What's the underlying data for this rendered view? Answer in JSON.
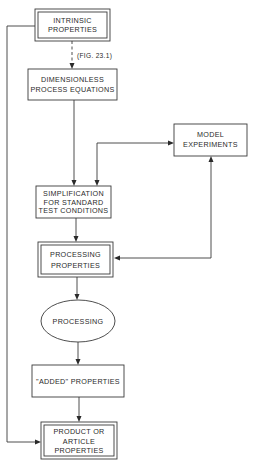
{
  "diagram": {
    "type": "flowchart",
    "nodes": {
      "intrinsic": {
        "lines": [
          "INTRINSIC",
          "PROPERTIES"
        ],
        "shape": "double-box"
      },
      "dimensionless": {
        "lines": [
          "DIMENSIONLESS",
          "PROCESS EQUATIONS"
        ],
        "shape": "box"
      },
      "model": {
        "lines": [
          "MODEL",
          "EXPERIMENTS"
        ],
        "shape": "box"
      },
      "simplification": {
        "lines": [
          "SIMPLIFICATION",
          "FOR STANDARD",
          "TEST CONDITIONS"
        ],
        "shape": "box"
      },
      "processing_properties": {
        "lines": [
          "PROCESSING",
          "PROPERTIES"
        ],
        "shape": "double-box"
      },
      "processing": {
        "lines": [
          "PROCESSING"
        ],
        "shape": "ellipse"
      },
      "added": {
        "lines": [
          "\"ADDED\" PROPERTIES"
        ],
        "shape": "box"
      },
      "product": {
        "lines": [
          "PRODUCT OR",
          "ARTICLE",
          "PROPERTIES"
        ],
        "shape": "double-box"
      }
    },
    "edges": [
      {
        "from": "intrinsic",
        "to": "dimensionless",
        "style": "dashed",
        "label": "(FIG. 23.1)"
      },
      {
        "from": "dimensionless",
        "to": "simplification",
        "style": "solid"
      },
      {
        "from": "model",
        "to": "simplification",
        "style": "solid",
        "bidirectional": true
      },
      {
        "from": "processing_properties",
        "to": "model",
        "style": "solid",
        "bidirectional": true
      },
      {
        "from": "simplification",
        "to": "processing_properties",
        "style": "solid"
      },
      {
        "from": "processing_properties",
        "to": "processing",
        "style": "solid"
      },
      {
        "from": "processing",
        "to": "added",
        "style": "solid"
      },
      {
        "from": "added",
        "to": "product",
        "style": "solid"
      },
      {
        "from": "intrinsic",
        "to": "product",
        "style": "solid"
      }
    ],
    "edge_label": "(FIG. 23.1)"
  }
}
